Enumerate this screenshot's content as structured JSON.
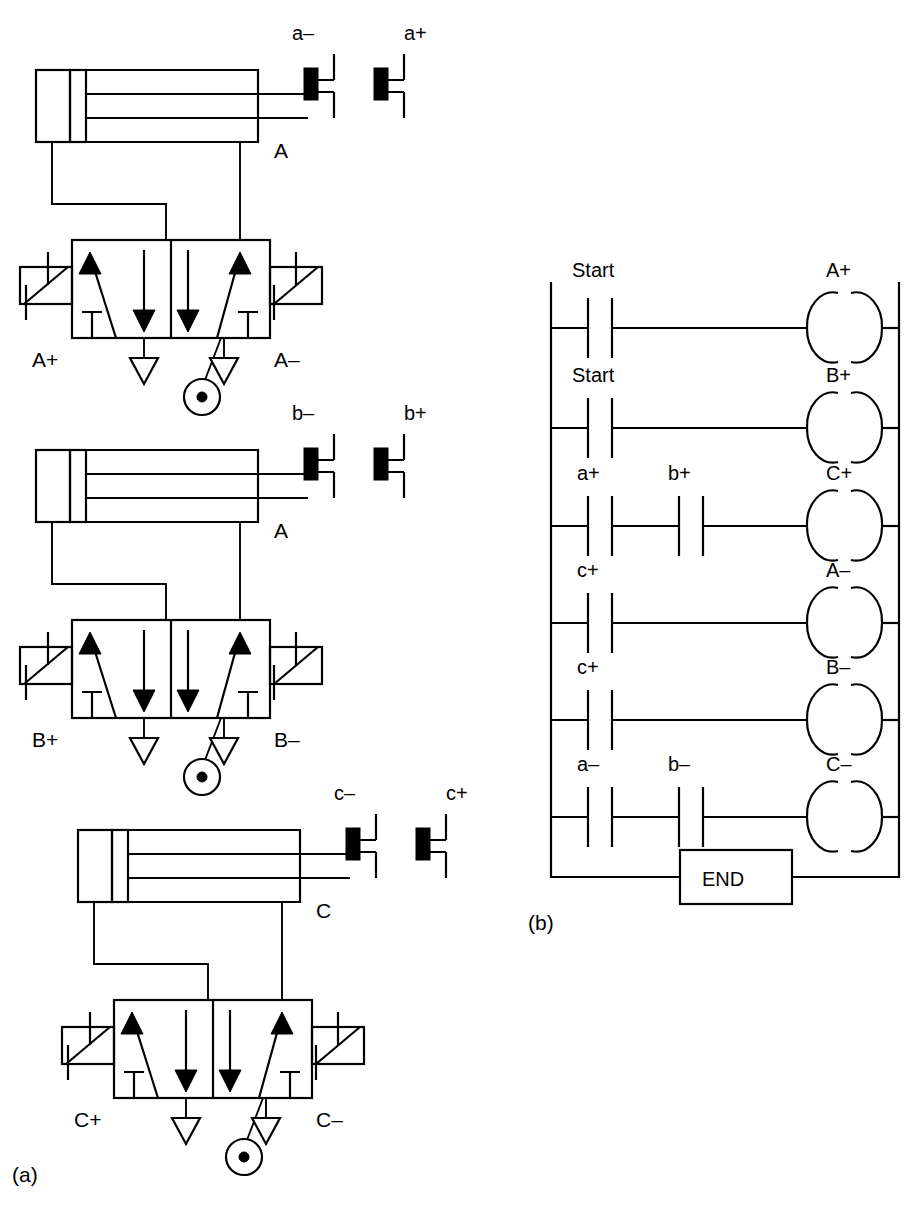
{
  "figure": {
    "panel_a_label": "(a)",
    "panel_b_label": "(b)"
  },
  "pneumatic_circuits": [
    {
      "id": "circuit-a",
      "cylinder_label": "A",
      "limit_switch_retracted": "a–",
      "limit_switch_extended": "a+",
      "valve_solenoid_left": "A+",
      "valve_solenoid_right": "A–"
    },
    {
      "id": "circuit-b",
      "cylinder_label": "A",
      "limit_switch_retracted": "b–",
      "limit_switch_extended": "b+",
      "valve_solenoid_left": "B+",
      "valve_solenoid_right": "B–"
    },
    {
      "id": "circuit-c",
      "cylinder_label": "C",
      "limit_switch_retracted": "c–",
      "limit_switch_extended": "c+",
      "valve_solenoid_left": "C+",
      "valve_solenoid_right": "C–"
    }
  ],
  "ladder": {
    "end_label": "END",
    "rungs": [
      {
        "contacts": [
          "Start"
        ],
        "coil": "A+"
      },
      {
        "contacts": [
          "Start"
        ],
        "coil": "B+"
      },
      {
        "contacts": [
          "a+",
          "b+"
        ],
        "coil": "C+"
      },
      {
        "contacts": [
          "c+"
        ],
        "coil": "A–"
      },
      {
        "contacts": [
          "c+"
        ],
        "coil": "B–"
      },
      {
        "contacts": [
          "a–",
          "b–"
        ],
        "coil": "C–"
      }
    ]
  },
  "colors": {
    "line": "#000000",
    "background": "#ffffff"
  }
}
